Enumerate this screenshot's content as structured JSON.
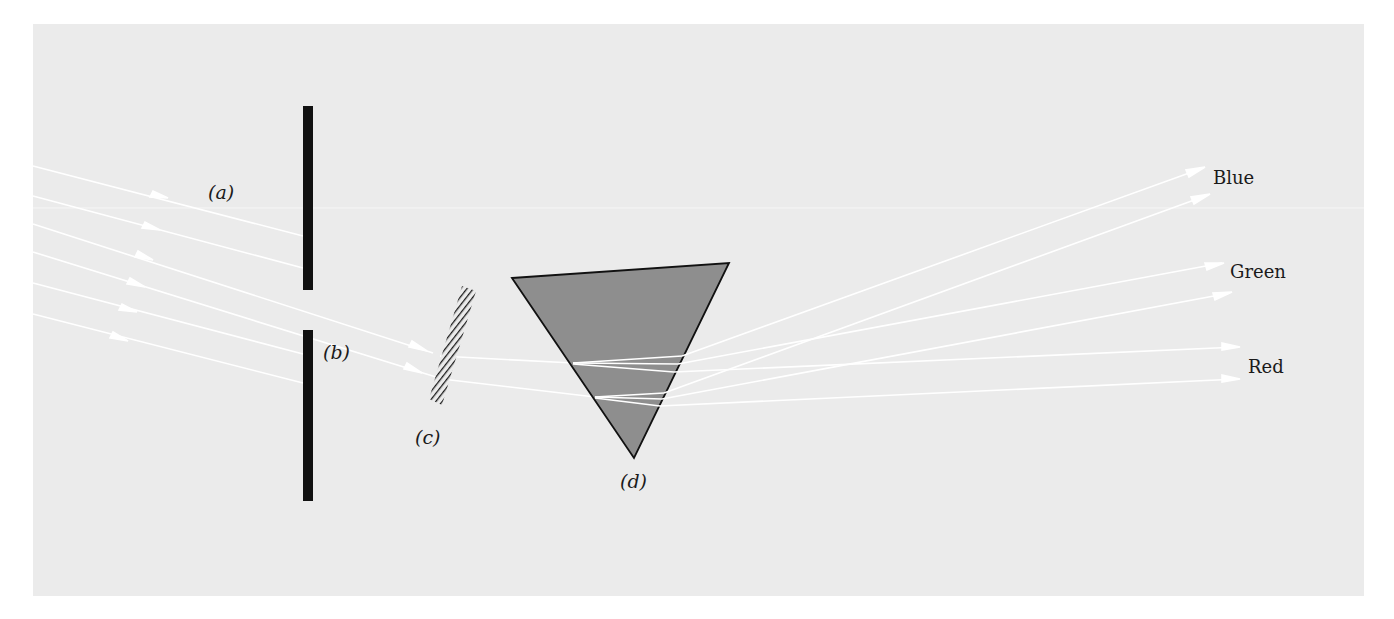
{
  "figure": {
    "colors": {
      "page_background": "#ffffff",
      "panel_background": "#ebebeb",
      "ray_color": "#ffffff",
      "barrier_color": "#111111",
      "prism_fill": "#8e8e8e",
      "prism_stroke": "#111111",
      "filter_hatch": "#1a1a1a",
      "text_color": "#1a1a1a"
    },
    "labels": {
      "a": "(a)",
      "b": "(b)",
      "c": "(c)",
      "d": "(d)"
    },
    "spectrum_labels": {
      "blue": "Blue",
      "green": "Green",
      "red": "Red"
    },
    "components": [
      {
        "id": "a",
        "name": "incident-light-rays"
      },
      {
        "id": "b",
        "name": "slit-barrier"
      },
      {
        "id": "c",
        "name": "filter"
      },
      {
        "id": "d",
        "name": "prism"
      }
    ],
    "incident_ray_count": 6,
    "transmitted_ray_count": 2,
    "output_beams": [
      "Blue",
      "Green",
      "Red"
    ]
  }
}
